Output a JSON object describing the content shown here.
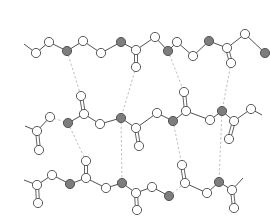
{
  "diagram": {
    "type": "molecular-hydrogen-bond-network",
    "colors": {
      "background": "#ffffff",
      "bond": "#3c3c3c",
      "atom_white": "#ffffff",
      "atom_gray": "#7d7d7d",
      "atom_outline": "#4a4a4a",
      "hydrogen_bond": "#b5b5b5"
    },
    "atom_radius": 4.6,
    "chains": [
      {
        "name": "top-chain",
        "atoms": [
          {
            "id": "t0",
            "x": 24,
            "y": 44,
            "kind": "end"
          },
          {
            "id": "t1",
            "x": 36,
            "y": 53,
            "kind": "white"
          },
          {
            "id": "t2",
            "x": 49,
            "y": 42,
            "kind": "white"
          },
          {
            "id": "t3",
            "x": 67,
            "y": 51,
            "kind": "gray"
          },
          {
            "id": "t4",
            "x": 83,
            "y": 41,
            "kind": "white"
          },
          {
            "id": "t5",
            "x": 101,
            "y": 53,
            "kind": "white"
          },
          {
            "id": "t6",
            "x": 121,
            "y": 42,
            "kind": "gray"
          },
          {
            "id": "t7",
            "x": 136,
            "y": 50,
            "kind": "white"
          },
          {
            "id": "t7o",
            "x": 136,
            "y": 67,
            "kind": "white"
          },
          {
            "id": "t8",
            "x": 155,
            "y": 37,
            "kind": "white"
          },
          {
            "id": "t9",
            "x": 168,
            "y": 51,
            "kind": "gray"
          },
          {
            "id": "t10",
            "x": 177,
            "y": 42,
            "kind": "white"
          },
          {
            "id": "t11",
            "x": 193,
            "y": 56,
            "kind": "white"
          },
          {
            "id": "t12",
            "x": 209,
            "y": 41,
            "kind": "gray"
          },
          {
            "id": "t13",
            "x": 227,
            "y": 48,
            "kind": "white"
          },
          {
            "id": "t13o",
            "x": 231,
            "y": 63,
            "kind": "white"
          },
          {
            "id": "t14",
            "x": 245,
            "y": 34,
            "kind": "white"
          },
          {
            "id": "t15",
            "x": 265,
            "y": 53,
            "kind": "gray"
          }
        ],
        "bonds": [
          [
            "t0",
            "t1"
          ],
          [
            "t1",
            "t2"
          ],
          [
            "t2",
            "t3"
          ],
          [
            "t3",
            "t4"
          ],
          [
            "t4",
            "t5"
          ],
          [
            "t5",
            "t6"
          ],
          [
            "t6",
            "t7"
          ],
          [
            "t7",
            "t8"
          ],
          [
            "t8",
            "t9"
          ],
          [
            "t9",
            "t10"
          ],
          [
            "t10",
            "t11"
          ],
          [
            "t11",
            "t12"
          ],
          [
            "t12",
            "t13"
          ],
          [
            "t13",
            "t14"
          ],
          [
            "t14",
            "t15"
          ]
        ],
        "double_bonds": [
          [
            "t7",
            "t7o"
          ],
          [
            "t13",
            "t13o"
          ]
        ]
      },
      {
        "name": "middle-chain",
        "atoms": [
          {
            "id": "m0",
            "x": 25,
            "y": 126,
            "kind": "end"
          },
          {
            "id": "m1",
            "x": 37,
            "y": 131,
            "kind": "white"
          },
          {
            "id": "m1o",
            "x": 39,
            "y": 150,
            "kind": "white"
          },
          {
            "id": "m2",
            "x": 50,
            "y": 117,
            "kind": "white"
          },
          {
            "id": "m3",
            "x": 68,
            "y": 123,
            "kind": "gray"
          },
          {
            "id": "m4",
            "x": 84,
            "y": 114,
            "kind": "white"
          },
          {
            "id": "m4o",
            "x": 81,
            "y": 96,
            "kind": "white"
          },
          {
            "id": "m5",
            "x": 100,
            "y": 124,
            "kind": "white"
          },
          {
            "id": "m6",
            "x": 121,
            "y": 118,
            "kind": "gray"
          },
          {
            "id": "m7",
            "x": 136,
            "y": 128,
            "kind": "white"
          },
          {
            "id": "m7o",
            "x": 139,
            "y": 146,
            "kind": "white"
          },
          {
            "id": "m8",
            "x": 157,
            "y": 113,
            "kind": "white"
          },
          {
            "id": "m9",
            "x": 173,
            "y": 121,
            "kind": "gray"
          },
          {
            "id": "m10",
            "x": 186,
            "y": 111,
            "kind": "white"
          },
          {
            "id": "m10o",
            "x": 184,
            "y": 92,
            "kind": "white"
          },
          {
            "id": "m11",
            "x": 210,
            "y": 120,
            "kind": "white"
          },
          {
            "id": "m12",
            "x": 222,
            "y": 111,
            "kind": "gray"
          },
          {
            "id": "m13",
            "x": 234,
            "y": 121,
            "kind": "white"
          },
          {
            "id": "m13o",
            "x": 229,
            "y": 139,
            "kind": "white"
          },
          {
            "id": "m14",
            "x": 251,
            "y": 109,
            "kind": "white"
          },
          {
            "id": "m15",
            "x": 262,
            "y": 115,
            "kind": "end"
          }
        ],
        "bonds": [
          [
            "m0",
            "m1"
          ],
          [
            "m1",
            "m2"
          ],
          [
            "m3",
            "m4"
          ],
          [
            "m4",
            "m5"
          ],
          [
            "m5",
            "m6"
          ],
          [
            "m6",
            "m7"
          ],
          [
            "m7",
            "m8"
          ],
          [
            "m8",
            "m9"
          ],
          [
            "m9",
            "m10"
          ],
          [
            "m10",
            "m11"
          ],
          [
            "m11",
            "m12"
          ],
          [
            "m12",
            "m13"
          ],
          [
            "m13",
            "m14"
          ],
          [
            "m14",
            "m15"
          ]
        ],
        "double_bonds": [
          [
            "m1",
            "m1o"
          ],
          [
            "m4",
            "m4o"
          ],
          [
            "m7",
            "m7o"
          ],
          [
            "m10",
            "m10o"
          ],
          [
            "m13",
            "m13o"
          ]
        ]
      },
      {
        "name": "bottom-chain",
        "atoms": [
          {
            "id": "b0",
            "x": 24,
            "y": 180,
            "kind": "end"
          },
          {
            "id": "b1",
            "x": 37,
            "y": 185,
            "kind": "white"
          },
          {
            "id": "b1o",
            "x": 38,
            "y": 203,
            "kind": "white"
          },
          {
            "id": "b2",
            "x": 52,
            "y": 175,
            "kind": "white"
          },
          {
            "id": "b3",
            "x": 70,
            "y": 184,
            "kind": "gray"
          },
          {
            "id": "b4",
            "x": 86,
            "y": 178,
            "kind": "white"
          },
          {
            "id": "b4o",
            "x": 86,
            "y": 161,
            "kind": "white"
          },
          {
            "id": "b5",
            "x": 106,
            "y": 188,
            "kind": "white"
          },
          {
            "id": "b6",
            "x": 122,
            "y": 183,
            "kind": "gray"
          },
          {
            "id": "b7",
            "x": 136,
            "y": 193,
            "kind": "white"
          },
          {
            "id": "b7o",
            "x": 137,
            "y": 210,
            "kind": "white"
          },
          {
            "id": "b8",
            "x": 152,
            "y": 187,
            "kind": "white"
          },
          {
            "id": "b9",
            "x": 169,
            "y": 196,
            "kind": "gray"
          },
          {
            "id": "b10",
            "x": 185,
            "y": 183,
            "kind": "white"
          },
          {
            "id": "b10o",
            "x": 182,
            "y": 165,
            "kind": "white"
          },
          {
            "id": "b11",
            "x": 207,
            "y": 193,
            "kind": "white"
          },
          {
            "id": "b12",
            "x": 219,
            "y": 182,
            "kind": "gray"
          },
          {
            "id": "b13",
            "x": 232,
            "y": 190,
            "kind": "white"
          },
          {
            "id": "b13o",
            "x": 234,
            "y": 208,
            "kind": "white"
          },
          {
            "id": "b14",
            "x": 243,
            "y": 178,
            "kind": "end"
          }
        ],
        "bonds": [
          [
            "b0",
            "b1"
          ],
          [
            "b1",
            "b2"
          ],
          [
            "b2",
            "b3"
          ],
          [
            "b3",
            "b4"
          ],
          [
            "b4",
            "b5"
          ],
          [
            "b5",
            "b6"
          ],
          [
            "b6",
            "b7"
          ],
          [
            "b7",
            "b8"
          ],
          [
            "b8",
            "b9"
          ],
          [
            "b10",
            "b11"
          ],
          [
            "b11",
            "b12"
          ],
          [
            "b12",
            "b13"
          ],
          [
            "b13",
            "b14"
          ]
        ],
        "double_bonds": [
          [
            "b1",
            "b1o"
          ],
          [
            "b4",
            "b4o"
          ],
          [
            "b7",
            "b7o"
          ],
          [
            "b10",
            "b10o"
          ],
          [
            "b13",
            "b13o"
          ]
        ]
      }
    ],
    "hydrogen_bonds": [
      [
        "t3",
        "m4o"
      ],
      [
        "t7o",
        "m6"
      ],
      [
        "t9",
        "m10o"
      ],
      [
        "t13o",
        "m12"
      ],
      [
        "m2",
        "m3"
      ],
      [
        "m3",
        "b4o"
      ],
      [
        "m6",
        "b6"
      ],
      [
        "m9",
        "b10o"
      ],
      [
        "m12",
        "b12"
      ],
      [
        "b9",
        "b10"
      ]
    ]
  }
}
